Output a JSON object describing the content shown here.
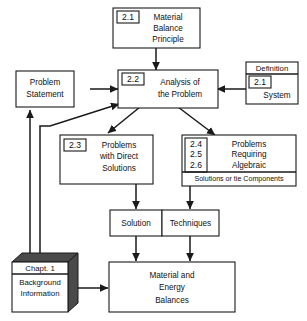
{
  "diagram": {
    "nodes": {
      "material_balance_principle": {
        "tag": "2.1",
        "line1": "Material",
        "line2": "Balance",
        "line3": "Principle"
      },
      "analysis_of_the_problem": {
        "tag": "2.2",
        "line1": "Analysis  of",
        "line2": "the Problem"
      },
      "problem_statement": {
        "line1": "Problem",
        "line2": "Statement"
      },
      "definition_system": {
        "header": "Definition",
        "tag": "2.1",
        "label": "System"
      },
      "problems_direct_solutions": {
        "tag": "2.3",
        "line1": "Problems",
        "line2": "with  Direct",
        "line3": "Solutions"
      },
      "problems_algebraic": {
        "tag1": "2.4",
        "tag2": "2.5",
        "tag3": "2.6",
        "line1": "Problems",
        "line2": "Requiring",
        "line3": "Algebraic",
        "footer": "Solutions or tie Components"
      },
      "solution": {
        "label": "Solution"
      },
      "techniques": {
        "label": "Techniques"
      },
      "chapter_one": {
        "header": "Chapt. 1",
        "line1": "Background",
        "line2": "Information"
      },
      "material_energy_balances": {
        "line1": "Material and",
        "line2": "Energy",
        "line3": "Balances"
      }
    },
    "colors": {
      "stroke": "#1a1a1a",
      "fill": "#ffffff",
      "shadow": "#4a4a4a"
    }
  }
}
